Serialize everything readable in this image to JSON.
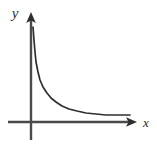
{
  "figure": {
    "name": "decaying-curve-graph",
    "background_color": "#ffffff",
    "width": 157,
    "height": 148,
    "stroke_color": "#4a4a4a",
    "curve_color": "#2e2e2e",
    "label_color": "#2b2b2b"
  },
  "axes": {
    "x_axis": {
      "label": "x",
      "label_style": "italic",
      "arrow": "right-arrowhead",
      "start_x": 8,
      "end_x": 137,
      "y": 122,
      "label_x": 146,
      "label_y": 127
    },
    "y_axis": {
      "label": "y",
      "label_style": "italic",
      "arrow": "up-arrowhead",
      "x": 31,
      "top_y": 12,
      "bottom_y": 140,
      "label_x": 15,
      "label_y": 18
    },
    "origin": {
      "x": 31,
      "y": 122
    }
  },
  "chart_data": {
    "type": "line",
    "title": "",
    "subtitle": "",
    "xlabel": "x",
    "ylabel": "y",
    "grid": false,
    "legend": false,
    "legend_position": "none",
    "axis_ticks": [],
    "tick_labels": [],
    "annotations": [],
    "series": [
      {
        "name": "decay-curve",
        "color": "#2e2e2e",
        "points_px": [
          [
            33,
            27
          ],
          [
            34,
            40
          ],
          [
            35,
            52
          ],
          [
            36,
            62
          ],
          [
            38,
            72
          ],
          [
            40,
            80
          ],
          [
            43,
            87
          ],
          [
            47,
            93
          ],
          [
            51,
            98
          ],
          [
            56,
            102
          ],
          [
            62,
            106
          ],
          [
            69,
            109
          ],
          [
            77,
            111
          ],
          [
            86,
            113
          ],
          [
            96,
            114
          ],
          [
            106,
            115
          ],
          [
            118,
            115
          ],
          [
            130,
            115
          ]
        ],
        "x": [
          0.08,
          0.1,
          0.13,
          0.16,
          0.2,
          0.26,
          0.33,
          0.42,
          0.53,
          0.66,
          0.82,
          1.0,
          1.25,
          1.55,
          1.9,
          2.3,
          2.8,
          3.3
        ],
        "y": [
          3.0,
          2.55,
          2.1,
          1.75,
          1.45,
          1.15,
          0.92,
          0.7,
          0.55,
          0.42,
          0.3,
          0.22,
          0.15,
          0.1,
          0.07,
          0.05,
          0.04,
          0.04
        ]
      }
    ],
    "xlim": [
      0,
      3.4
    ],
    "ylim": [
      0,
      3.2
    ]
  }
}
